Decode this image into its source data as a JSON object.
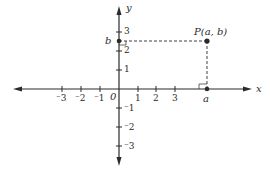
{
  "diagram": {
    "type": "cartesian-plane",
    "colors": {
      "ink": "#2a2a2a",
      "background": "#ffffff"
    },
    "axes": {
      "x_label": "x",
      "y_label": "y",
      "origin_label": "0",
      "x_ticks": [
        {
          "value": -3,
          "label": "⁻3"
        },
        {
          "value": -2,
          "label": "⁻2"
        },
        {
          "value": -1,
          "label": "⁻1"
        },
        {
          "value": 1,
          "label": "1"
        },
        {
          "value": 2,
          "label": "2"
        },
        {
          "value": 3,
          "label": "3"
        }
      ],
      "y_ticks": [
        {
          "value": 3,
          "label": "3"
        },
        {
          "value": 2,
          "label": "2"
        },
        {
          "value": 1,
          "label": "1"
        },
        {
          "value": -1,
          "label": "⁻1"
        },
        {
          "value": -2,
          "label": "⁻2"
        },
        {
          "value": -3,
          "label": "⁻3"
        }
      ]
    },
    "point": {
      "label": "P(a, b)",
      "x_label": "a",
      "y_label": "b"
    }
  }
}
